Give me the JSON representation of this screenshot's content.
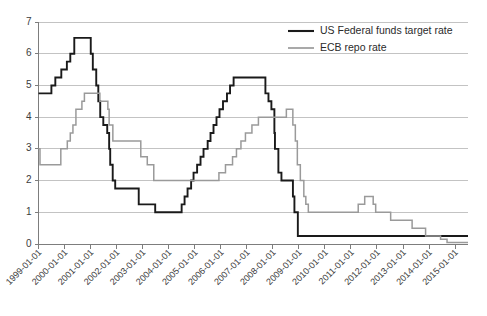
{
  "chart_data": {
    "type": "line",
    "title": "",
    "subtitle": "",
    "xlabel": "",
    "ylabel": "",
    "ylim": [
      0,
      7
    ],
    "xlim": [
      "1999-01-01",
      "2015-07-01"
    ],
    "grid": true,
    "legend_position": "top-right",
    "step_style": "post",
    "y_ticks": [
      "0",
      "1",
      "2",
      "3",
      "4",
      "5",
      "6",
      "7"
    ],
    "y_tick_values": [
      0,
      1,
      2,
      3,
      4,
      5,
      6,
      7
    ],
    "x_ticks": [
      "1999-01-01",
      "2000-01-01",
      "2001-01-01",
      "2002-01-01",
      "2003-01-01",
      "2004-01-01",
      "2005-01-01",
      "2006-01-01",
      "2007-01-01",
      "2008-01-01",
      "2009-01-01",
      "2010-01-01",
      "2011-01-01",
      "2012-01-01",
      "2013-01-01",
      "2014-01-01",
      "2015-01-01"
    ],
    "series": [
      {
        "name": "US Federal funds target rate",
        "color": "#1a1a1a",
        "points": [
          {
            "x": "1999-01-01",
            "y": 4.75
          },
          {
            "x": "1999-07-01",
            "y": 5.0
          },
          {
            "x": "1999-08-25",
            "y": 5.25
          },
          {
            "x": "1999-11-17",
            "y": 5.5
          },
          {
            "x": "2000-02-03",
            "y": 5.75
          },
          {
            "x": "2000-03-22",
            "y": 6.0
          },
          {
            "x": "2000-05-17",
            "y": 6.5
          },
          {
            "x": "2001-01-03",
            "y": 6.0
          },
          {
            "x": "2001-02-01",
            "y": 5.5
          },
          {
            "x": "2001-03-21",
            "y": 5.0
          },
          {
            "x": "2001-04-19",
            "y": 4.5
          },
          {
            "x": "2001-05-16",
            "y": 4.0
          },
          {
            "x": "2001-06-28",
            "y": 3.75
          },
          {
            "x": "2001-08-22",
            "y": 3.5
          },
          {
            "x": "2001-09-18",
            "y": 3.0
          },
          {
            "x": "2001-10-03",
            "y": 2.5
          },
          {
            "x": "2001-11-07",
            "y": 2.0
          },
          {
            "x": "2001-12-12",
            "y": 1.75
          },
          {
            "x": "2002-11-07",
            "y": 1.25
          },
          {
            "x": "2003-06-26",
            "y": 1.0
          },
          {
            "x": "2004-07-01",
            "y": 1.25
          },
          {
            "x": "2004-08-11",
            "y": 1.5
          },
          {
            "x": "2004-09-22",
            "y": 1.75
          },
          {
            "x": "2004-11-11",
            "y": 2.0
          },
          {
            "x": "2004-12-15",
            "y": 2.25
          },
          {
            "x": "2005-02-03",
            "y": 2.5
          },
          {
            "x": "2005-03-23",
            "y": 2.75
          },
          {
            "x": "2005-05-04",
            "y": 3.0
          },
          {
            "x": "2005-07-01",
            "y": 3.25
          },
          {
            "x": "2005-08-10",
            "y": 3.5
          },
          {
            "x": "2005-09-21",
            "y": 3.75
          },
          {
            "x": "2005-11-02",
            "y": 4.0
          },
          {
            "x": "2005-12-14",
            "y": 4.25
          },
          {
            "x": "2006-02-01",
            "y": 4.5
          },
          {
            "x": "2006-03-29",
            "y": 4.75
          },
          {
            "x": "2006-05-11",
            "y": 5.0
          },
          {
            "x": "2006-06-30",
            "y": 5.25
          },
          {
            "x": "2007-09-19",
            "y": 4.75
          },
          {
            "x": "2007-11-01",
            "y": 4.5
          },
          {
            "x": "2007-12-12",
            "y": 4.25
          },
          {
            "x": "2008-01-23",
            "y": 3.5
          },
          {
            "x": "2008-01-31",
            "y": 3.0
          },
          {
            "x": "2008-03-19",
            "y": 2.25
          },
          {
            "x": "2008-05-01",
            "y": 2.0
          },
          {
            "x": "2008-10-09",
            "y": 1.5
          },
          {
            "x": "2008-10-30",
            "y": 1.0
          },
          {
            "x": "2008-12-17",
            "y": 0.25
          },
          {
            "x": "2015-07-01",
            "y": 0.25
          }
        ]
      },
      {
        "name": "ECB repo rate",
        "color": "#9a9a9a",
        "points": [
          {
            "x": "1999-01-01",
            "y": 3.0
          },
          {
            "x": "1999-01-22",
            "y": 2.5
          },
          {
            "x": "1999-11-10",
            "y": 3.0
          },
          {
            "x": "2000-02-09",
            "y": 3.25
          },
          {
            "x": "2000-03-22",
            "y": 3.5
          },
          {
            "x": "2000-04-28",
            "y": 3.75
          },
          {
            "x": "2000-06-09",
            "y": 4.25
          },
          {
            "x": "2000-09-01",
            "y": 4.5
          },
          {
            "x": "2000-10-06",
            "y": 4.75
          },
          {
            "x": "2001-05-11",
            "y": 4.5
          },
          {
            "x": "2001-08-31",
            "y": 4.25
          },
          {
            "x": "2001-09-18",
            "y": 3.75
          },
          {
            "x": "2001-11-09",
            "y": 3.25
          },
          {
            "x": "2002-12-06",
            "y": 2.75
          },
          {
            "x": "2003-03-07",
            "y": 2.5
          },
          {
            "x": "2003-06-06",
            "y": 2.0
          },
          {
            "x": "2005-12-06",
            "y": 2.25
          },
          {
            "x": "2006-03-08",
            "y": 2.5
          },
          {
            "x": "2006-06-15",
            "y": 2.75
          },
          {
            "x": "2006-08-09",
            "y": 3.0
          },
          {
            "x": "2006-10-11",
            "y": 3.25
          },
          {
            "x": "2006-12-13",
            "y": 3.5
          },
          {
            "x": "2007-03-14",
            "y": 3.75
          },
          {
            "x": "2007-06-13",
            "y": 4.0
          },
          {
            "x": "2008-07-09",
            "y": 4.25
          },
          {
            "x": "2008-10-08",
            "y": 3.75
          },
          {
            "x": "2008-11-12",
            "y": 3.25
          },
          {
            "x": "2008-12-10",
            "y": 2.5
          },
          {
            "x": "2009-01-21",
            "y": 2.0
          },
          {
            "x": "2009-03-11",
            "y": 1.5
          },
          {
            "x": "2009-04-08",
            "y": 1.25
          },
          {
            "x": "2009-05-13",
            "y": 1.0
          },
          {
            "x": "2011-04-13",
            "y": 1.25
          },
          {
            "x": "2011-07-13",
            "y": 1.5
          },
          {
            "x": "2011-11-09",
            "y": 1.25
          },
          {
            "x": "2011-12-14",
            "y": 1.0
          },
          {
            "x": "2012-07-11",
            "y": 0.75
          },
          {
            "x": "2013-05-08",
            "y": 0.5
          },
          {
            "x": "2013-11-13",
            "y": 0.25
          },
          {
            "x": "2014-06-11",
            "y": 0.15
          },
          {
            "x": "2014-09-10",
            "y": 0.05
          },
          {
            "x": "2015-07-01",
            "y": 0.05
          }
        ]
      }
    ]
  },
  "legend": {
    "items": [
      {
        "label": "US Federal funds target rate",
        "color": "#1a1a1a"
      },
      {
        "label": "ECB repo rate",
        "color": "#9a9a9a"
      }
    ]
  },
  "colors": {
    "us_rate": "#1a1a1a",
    "ecb_rate": "#9a9a9a",
    "gridline": "#b4b4b4",
    "axis": "#7d7d7d",
    "background": "#ffffff"
  }
}
